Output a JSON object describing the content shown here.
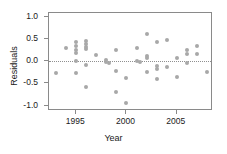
{
  "chart_data": {
    "type": "scatter",
    "title": "",
    "xlabel": "Year",
    "ylabel": "Residuals",
    "xlim": [
      1992.3,
      2008.6
    ],
    "ylim": [
      -1.12,
      1.08
    ],
    "xticks": [
      1995,
      2000,
      2005
    ],
    "xtick_labels": [
      "1995",
      "2000",
      "2005"
    ],
    "yticks": [
      1.0,
      0.5,
      0.0,
      -0.5,
      -1.0
    ],
    "ytick_labels": [
      "1.0",
      "0.5",
      "0.0",
      "-0.5",
      "-1.0"
    ],
    "grid": false,
    "legend": null,
    "reference_line": {
      "y": 0.0,
      "style": "dotted",
      "color": "#909090"
    },
    "marker": {
      "shape": "circle",
      "color": "#a8a8a8",
      "size": 4
    },
    "points": [
      {
        "x": 1993.0,
        "y": -0.27
      },
      {
        "x": 1994.0,
        "y": 0.29
      },
      {
        "x": 1995.0,
        "y": 0.43
      },
      {
        "x": 1995.0,
        "y": 0.33
      },
      {
        "x": 1995.0,
        "y": 0.24
      },
      {
        "x": 1995.0,
        "y": 0.18
      },
      {
        "x": 1995.0,
        "y": 0.0
      },
      {
        "x": 1995.0,
        "y": -0.26
      },
      {
        "x": 1996.0,
        "y": 0.45
      },
      {
        "x": 1996.0,
        "y": 0.39
      },
      {
        "x": 1996.0,
        "y": 0.31
      },
      {
        "x": 1996.0,
        "y": 0.28
      },
      {
        "x": 1996.0,
        "y": -0.09
      },
      {
        "x": 1996.0,
        "y": -0.58
      },
      {
        "x": 1997.0,
        "y": 0.14
      },
      {
        "x": 1998.0,
        "y": 0.02
      },
      {
        "x": 1998.0,
        "y": -0.01
      },
      {
        "x": 1998.3,
        "y": -0.04
      },
      {
        "x": 1999.0,
        "y": 0.25
      },
      {
        "x": 1999.0,
        "y": -0.22
      },
      {
        "x": 1999.0,
        "y": -0.69
      },
      {
        "x": 2000.0,
        "y": -0.37
      },
      {
        "x": 2000.0,
        "y": -0.95
      },
      {
        "x": 2001.0,
        "y": 0.29
      },
      {
        "x": 2001.0,
        "y": 0.0
      },
      {
        "x": 2001.3,
        "y": -0.02
      },
      {
        "x": 2002.0,
        "y": 0.6
      },
      {
        "x": 2002.0,
        "y": 0.11
      },
      {
        "x": 2002.0,
        "y": 0.06
      },
      {
        "x": 2002.0,
        "y": -0.24
      },
      {
        "x": 2003.0,
        "y": 0.43
      },
      {
        "x": 2003.0,
        "y": -0.12
      },
      {
        "x": 2003.0,
        "y": -0.18
      },
      {
        "x": 2003.0,
        "y": -0.41
      },
      {
        "x": 2004.0,
        "y": 0.47
      },
      {
        "x": 2004.0,
        "y": -0.14
      },
      {
        "x": 2005.0,
        "y": 0.07
      },
      {
        "x": 2005.0,
        "y": -0.35
      },
      {
        "x": 2006.0,
        "y": 0.24
      },
      {
        "x": 2006.0,
        "y": 0.15
      },
      {
        "x": 2006.0,
        "y": -0.05
      },
      {
        "x": 2007.0,
        "y": 0.35
      },
      {
        "x": 2007.0,
        "y": 0.17
      },
      {
        "x": 2008.0,
        "y": -0.25
      }
    ]
  }
}
